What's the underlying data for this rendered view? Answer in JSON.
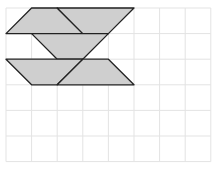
{
  "diagram": {
    "type": "grid-shapes",
    "grid": {
      "columns": 8,
      "rows": 6,
      "origin_px": [
        6,
        8
      ],
      "cell_px": 25.6,
      "line_color": "#e3e3e3",
      "background": "#ffffff"
    },
    "shape_style": {
      "fill": "#cfcfcf",
      "stroke": "#222222"
    },
    "shapes": [
      {
        "name": "top-left-trapezoid",
        "points": [
          [
            1,
            0
          ],
          [
            2,
            0
          ],
          [
            3,
            1
          ],
          [
            0,
            1
          ]
        ]
      },
      {
        "name": "top-right-trapezoid",
        "points": [
          [
            2,
            0
          ],
          [
            5,
            0
          ],
          [
            4,
            1
          ],
          [
            3,
            1
          ]
        ]
      },
      {
        "name": "middle-trapezoid",
        "points": [
          [
            1,
            1
          ],
          [
            4,
            1
          ],
          [
            3,
            2
          ],
          [
            2,
            2
          ]
        ]
      },
      {
        "name": "bottom-left-trapezoid",
        "points": [
          [
            0,
            2
          ],
          [
            3,
            2
          ],
          [
            2,
            3
          ],
          [
            1,
            3
          ]
        ]
      },
      {
        "name": "bottom-right-trapezoid",
        "points": [
          [
            3,
            2
          ],
          [
            4,
            2
          ],
          [
            5,
            3
          ],
          [
            2,
            3
          ]
        ]
      }
    ]
  }
}
